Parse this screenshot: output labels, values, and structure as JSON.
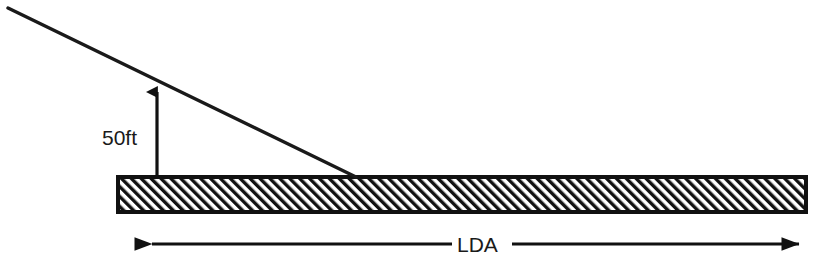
{
  "diagram": {
    "background_color": "#ffffff",
    "ink_color": "#1a1a1a",
    "labels": {
      "height_label": "50ft",
      "distance_label": "LDA"
    },
    "runway": {
      "name": "runway-surface",
      "fill_pattern": "diagonal-hatch",
      "hatch_angle_deg": 45,
      "hatch_spacing_px": 7,
      "border_color": "#111111",
      "x": 118,
      "y": 177,
      "width": 688,
      "height": 35
    },
    "glideslope": {
      "name": "glideslope-line",
      "x1": 8,
      "y1": 8,
      "x2": 356,
      "y2": 177,
      "stroke_width": 3
    },
    "height_arrow": {
      "name": "height-dimension-arrow",
      "x": 157,
      "y_top": 84,
      "y_bottom": 177,
      "arrowhead": "up",
      "stroke_width": 3
    },
    "distance_arrow": {
      "name": "lda-dimension-arrow",
      "y": 244,
      "x_left": 150,
      "x_right": 801,
      "gap_left": 452,
      "gap_right": 512,
      "arrowheads": "both",
      "stroke_width": 3
    },
    "text_positions": {
      "height_label_x": 102,
      "height_label_y": 145,
      "distance_label_x": 457,
      "distance_label_y": 252
    }
  }
}
